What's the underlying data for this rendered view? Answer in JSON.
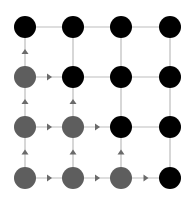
{
  "diagram": {
    "type": "grid-graph",
    "rows": 4,
    "cols": 4,
    "col_x": [
      25,
      73,
      121,
      170
    ],
    "row_y": [
      27,
      77,
      127,
      178
    ],
    "node_radius": 11,
    "colors": {
      "visited": "#5e5e5e",
      "unvisited": "#000000",
      "edge": "#bdbdbd",
      "arrow": "#6a6a6a",
      "background": "#ffffff"
    },
    "nodes": [
      {
        "r": 0,
        "c": 0,
        "state": "unvisited"
      },
      {
        "r": 0,
        "c": 1,
        "state": "unvisited"
      },
      {
        "r": 0,
        "c": 2,
        "state": "unvisited"
      },
      {
        "r": 0,
        "c": 3,
        "state": "unvisited"
      },
      {
        "r": 1,
        "c": 0,
        "state": "visited"
      },
      {
        "r": 1,
        "c": 1,
        "state": "unvisited"
      },
      {
        "r": 1,
        "c": 2,
        "state": "unvisited"
      },
      {
        "r": 1,
        "c": 3,
        "state": "unvisited"
      },
      {
        "r": 2,
        "c": 0,
        "state": "visited"
      },
      {
        "r": 2,
        "c": 1,
        "state": "visited"
      },
      {
        "r": 2,
        "c": 2,
        "state": "unvisited"
      },
      {
        "r": 2,
        "c": 3,
        "state": "unvisited"
      },
      {
        "r": 3,
        "c": 0,
        "state": "visited"
      },
      {
        "r": 3,
        "c": 1,
        "state": "visited"
      },
      {
        "r": 3,
        "c": 2,
        "state": "visited"
      },
      {
        "r": 3,
        "c": 3,
        "state": "unvisited"
      }
    ],
    "edges": [
      {
        "from": [
          0,
          0
        ],
        "to": [
          0,
          1
        ]
      },
      {
        "from": [
          0,
          1
        ],
        "to": [
          0,
          2
        ]
      },
      {
        "from": [
          0,
          2
        ],
        "to": [
          0,
          3
        ]
      },
      {
        "from": [
          1,
          0
        ],
        "to": [
          1,
          1
        ],
        "arrow": "right"
      },
      {
        "from": [
          1,
          1
        ],
        "to": [
          1,
          2
        ]
      },
      {
        "from": [
          1,
          2
        ],
        "to": [
          1,
          3
        ]
      },
      {
        "from": [
          2,
          0
        ],
        "to": [
          2,
          1
        ],
        "arrow": "right"
      },
      {
        "from": [
          2,
          1
        ],
        "to": [
          2,
          2
        ],
        "arrow": "right"
      },
      {
        "from": [
          2,
          2
        ],
        "to": [
          2,
          3
        ]
      },
      {
        "from": [
          3,
          0
        ],
        "to": [
          3,
          1
        ],
        "arrow": "right"
      },
      {
        "from": [
          3,
          1
        ],
        "to": [
          3,
          2
        ],
        "arrow": "right"
      },
      {
        "from": [
          3,
          2
        ],
        "to": [
          3,
          3
        ],
        "arrow": "right"
      },
      {
        "from": [
          1,
          0
        ],
        "to": [
          0,
          0
        ],
        "arrow": "up"
      },
      {
        "from": [
          2,
          0
        ],
        "to": [
          1,
          0
        ],
        "arrow": "up"
      },
      {
        "from": [
          3,
          0
        ],
        "to": [
          2,
          0
        ],
        "arrow": "up"
      },
      {
        "from": [
          0,
          1
        ],
        "to": [
          1,
          1
        ]
      },
      {
        "from": [
          2,
          1
        ],
        "to": [
          1,
          1
        ],
        "arrow": "up"
      },
      {
        "from": [
          3,
          1
        ],
        "to": [
          2,
          1
        ],
        "arrow": "up"
      },
      {
        "from": [
          0,
          2
        ],
        "to": [
          1,
          2
        ]
      },
      {
        "from": [
          1,
          2
        ],
        "to": [
          2,
          2
        ]
      },
      {
        "from": [
          3,
          2
        ],
        "to": [
          2,
          2
        ],
        "arrow": "up"
      },
      {
        "from": [
          0,
          3
        ],
        "to": [
          1,
          3
        ]
      },
      {
        "from": [
          1,
          3
        ],
        "to": [
          2,
          3
        ]
      },
      {
        "from": [
          2,
          3
        ],
        "to": [
          3,
          3
        ]
      }
    ]
  }
}
